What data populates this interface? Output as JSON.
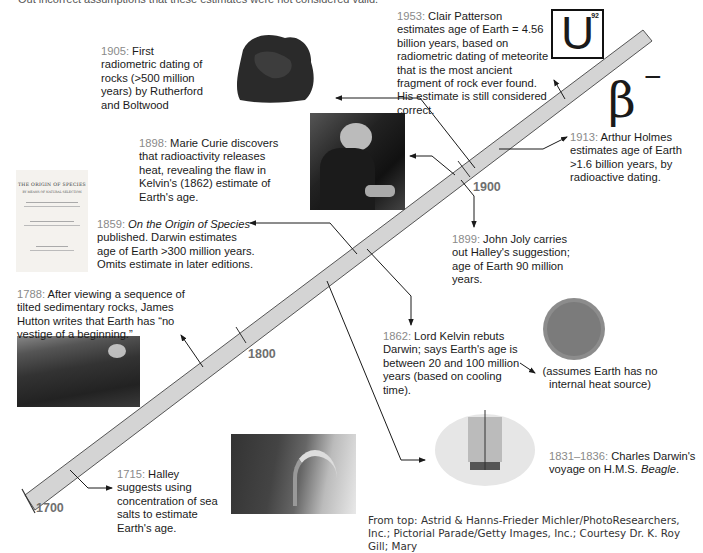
{
  "top_cut_text": "Out incorrect assumptions that these estimates were not considered valid.",
  "timeline": {
    "years": [
      "1700",
      "1800",
      "1900"
    ],
    "bar_color": "#d4d4d4",
    "year_color": "#8a8a8a"
  },
  "events": {
    "e1953": {
      "year": "1953:",
      "text": " Clair Patterson estimates age of Earth = 4.56 billion years, based on radiometric dating of meteorite that is the most ancient fragment of rock ever found. His estimate is still considered correct."
    },
    "e1913": {
      "year": "1913:",
      "text": " Arthur Holmes estimates age of Earth >1.6 billion years, by radioactive dating."
    },
    "e1905": {
      "year": "1905:",
      "text": " First radiometric dating of rocks (>500 million years) by Rutherford and Boltwood"
    },
    "e1899": {
      "year": "1899:",
      "text": " John Joly carries out Halley's suggestion; age of Earth 90 million years."
    },
    "e1898": {
      "year": "1898:",
      "text": " Marie Curie discovers that radioactivity releases heat, revealing the flaw in Kelvin's (1862) estimate of Earth's age."
    },
    "e1862": {
      "year": "1862:",
      "text": " Lord Kelvin rebuts Darwin; says Earth's age is between 20 and 100 million years (based on cooling time)."
    },
    "e1859": {
      "year": "1859:",
      "title": " On the Origin of Species",
      "text": " published. Darwin estimates age of Earth >300 million years. Omits estimate in later editions."
    },
    "e1831": {
      "year": "1831–1836:",
      "text": " Charles Darwin's voyage on H.M.S. ",
      "ship": "Beagle",
      "end": "."
    },
    "e1788": {
      "year": "1788:",
      "text": " After viewing a sequence of tilted sedimentary rocks, James Hutton writes that Earth has “no vestige of a beginning.”"
    },
    "e1715": {
      "year": "1715:",
      "text": " Halley suggests using concentration of sea salts to estimate Earth's age."
    }
  },
  "kelvin_note": "(assumes Earth has no internal heat source)",
  "uranium": {
    "symbol": "U",
    "number": "92"
  },
  "beta": {
    "symbol": "β",
    "sign": "−"
  },
  "book": {
    "title": "THE ORIGIN OF SPECIES",
    "sub": "BY MEANS OF NATURAL SELECTION"
  },
  "credits": "From top: Astrid & Hanns-Frieder Michler/PhotoResearchers, Inc.; Pictorial Parade/Getty Images, Inc.; Courtesy Dr. K. Roy Gill; Mary"
}
